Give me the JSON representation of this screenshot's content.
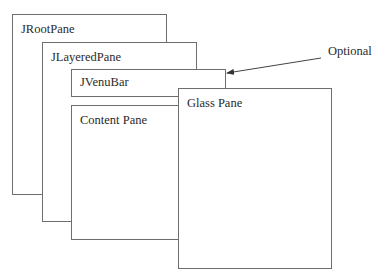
{
  "diagram": {
    "panes": [
      {
        "id": "jrootpane",
        "label": "JRootPane",
        "x": 12,
        "y": 14,
        "w": 155,
        "h": 181
      },
      {
        "id": "jlayeredpane",
        "label": "JLayeredPane",
        "x": 42,
        "y": 42,
        "w": 155,
        "h": 180
      },
      {
        "id": "jvenubar",
        "label": "JVenuBar",
        "x": 71,
        "y": 69,
        "w": 155,
        "h": 28
      },
      {
        "id": "content-pane",
        "label": "Content Pane",
        "x": 71,
        "y": 105,
        "w": 108,
        "h": 135
      },
      {
        "id": "glass-pane",
        "label": "Glass Pane",
        "x": 178,
        "y": 88,
        "w": 154,
        "h": 181
      }
    ],
    "annotation": {
      "label": "Optional",
      "x": 328,
      "y": 52,
      "arrow": {
        "from": [
          321,
          58
        ],
        "to": [
          227,
          73
        ]
      }
    },
    "colors": {
      "stroke": "#6e6e6e",
      "text": "#2a2a2a",
      "background": "#ffffff"
    }
  }
}
